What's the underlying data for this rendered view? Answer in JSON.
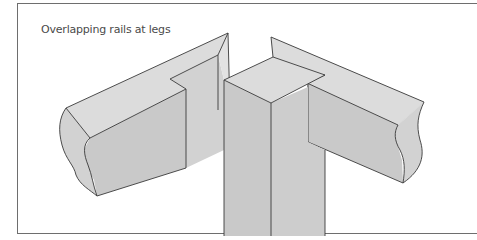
{
  "figure": {
    "caption": "Overlapping rails at legs",
    "parts": [
      {
        "id": "left-rail",
        "label": "Left rail"
      },
      {
        "id": "leg",
        "label": "Leg"
      },
      {
        "id": "right-rail",
        "label": "Right rail"
      }
    ],
    "colors": {
      "background": "#ffffff",
      "frame": "#6e6e6e",
      "top_face": "#dcdcdc",
      "front_face": "#c9c9c9",
      "side_face": "#d2d2d2",
      "line": "#3a3a3a",
      "caption": "#4a4a4a"
    }
  }
}
